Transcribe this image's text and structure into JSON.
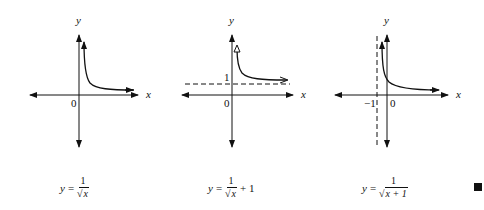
{
  "panels": [
    {
      "id": "graph-1",
      "axis_labels": {
        "x": "x",
        "y": "y"
      },
      "origin_label": "0",
      "formula": {
        "lhs": "y",
        "eq": "=",
        "num": "1",
        "den_sqrt": "x",
        "suffix": ""
      },
      "asymptote": null
    },
    {
      "id": "graph-2",
      "axis_labels": {
        "x": "x",
        "y": "y"
      },
      "origin_label": "0",
      "asymptote_label": "1",
      "formula": {
        "lhs": "y",
        "eq": "=",
        "num": "1",
        "den_sqrt": "x",
        "suffix": "+ 1"
      },
      "asymptote": {
        "type": "horizontal",
        "value": 1
      }
    },
    {
      "id": "graph-3",
      "axis_labels": {
        "x": "x",
        "y": "y"
      },
      "origin_label": "0",
      "asymptote_label": "−1",
      "formula": {
        "lhs": "y",
        "eq": "=",
        "num": "1",
        "den_sqrt": "x + 1",
        "suffix": ""
      },
      "asymptote": {
        "type": "vertical",
        "value": -1
      }
    }
  ],
  "end_marker": "filled-square",
  "colors": {
    "ink": "#111111",
    "background": "#ffffff"
  }
}
